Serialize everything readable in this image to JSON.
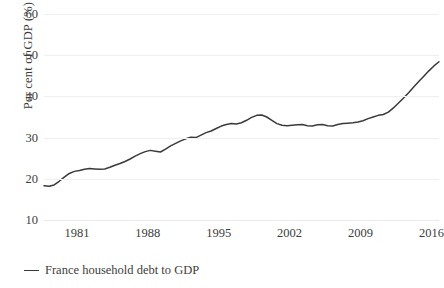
{
  "chart_data": {
    "type": "line",
    "title": "",
    "xlabel": "",
    "ylabel": "Per cent of GDP (%)",
    "ylim": [
      10,
      60
    ],
    "xlim": [
      1977.75,
      2016.75
    ],
    "grid": true,
    "legend_position": "bottom-left",
    "y_ticks": [
      10,
      20,
      30,
      40,
      50,
      60
    ],
    "y_tick_labels": [
      "10",
      "20",
      "30",
      "40",
      "50",
      "60"
    ],
    "x_ticks": [
      1981,
      1988,
      1995,
      2002,
      2009,
      2016
    ],
    "x_tick_labels": [
      "1981",
      "1988",
      "1995",
      "2002",
      "2009",
      "2016"
    ],
    "series": [
      {
        "name": "France household debt to GDP",
        "color": "#3a3a3a",
        "x": [
          1977.75,
          1978.25,
          1978.75,
          1979.25,
          1979.75,
          1980.25,
          1980.75,
          1981.25,
          1981.75,
          1982.25,
          1982.75,
          1983.25,
          1983.75,
          1984.25,
          1984.75,
          1985.25,
          1985.75,
          1986.25,
          1986.75,
          1987.25,
          1987.75,
          1988.25,
          1988.75,
          1989.25,
          1989.75,
          1990.25,
          1990.75,
          1991.25,
          1991.75,
          1992.25,
          1992.75,
          1993.25,
          1993.75,
          1994.25,
          1994.75,
          1995.25,
          1995.75,
          1996.25,
          1996.75,
          1997.25,
          1997.75,
          1998.25,
          1998.75,
          1999.25,
          1999.75,
          2000.25,
          2000.75,
          2001.25,
          2001.75,
          2002.25,
          2002.75,
          2003.25,
          2003.75,
          2004.25,
          2004.75,
          2005.25,
          2005.75,
          2006.25,
          2006.75,
          2007.25,
          2007.75,
          2008.25,
          2008.75,
          2009.25,
          2009.75,
          2010.25,
          2010.75,
          2011.25,
          2011.75,
          2012.25,
          2012.75,
          2013.25,
          2013.75,
          2014.25,
          2014.75,
          2015.25,
          2015.75,
          2016.25,
          2016.75
        ],
        "values": [
          18.3,
          18.2,
          18.5,
          19.4,
          20.4,
          21.3,
          21.8,
          22.0,
          22.3,
          22.5,
          22.4,
          22.3,
          22.4,
          22.8,
          23.3,
          23.7,
          24.2,
          24.8,
          25.5,
          26.1,
          26.6,
          26.9,
          26.7,
          26.5,
          27.2,
          28.0,
          28.6,
          29.2,
          29.7,
          30.1,
          30.0,
          30.6,
          31.2,
          31.6,
          32.2,
          32.8,
          33.2,
          33.4,
          33.3,
          33.6,
          34.2,
          34.9,
          35.4,
          35.5,
          35.0,
          34.2,
          33.4,
          33.0,
          32.9,
          33.0,
          33.1,
          33.2,
          32.9,
          32.8,
          33.1,
          33.2,
          32.9,
          32.8,
          33.2,
          33.4,
          33.5,
          33.6,
          33.8,
          34.1,
          34.6,
          35.0,
          35.4,
          35.6,
          36.2,
          37.2,
          38.4,
          39.6,
          40.9,
          42.3,
          43.6,
          44.9,
          46.2,
          47.4,
          48.4
        ]
      }
    ],
    "series_tail": {
      "name": "France household debt to GDP (continued)",
      "note": "continuation of the same single series to 2016"
    }
  },
  "legend": {
    "entries": [
      {
        "label": "France household debt to GDP",
        "color": "#3a3a3a",
        "marker": "line-dash"
      }
    ]
  },
  "axes": {
    "y_title": "Per cent of GDP (%)"
  }
}
